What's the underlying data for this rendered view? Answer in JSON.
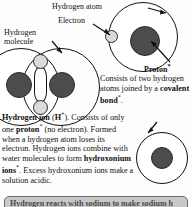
{
  "labels": {
    "hydrogen_atom": "Hydrogen atom",
    "electron": "Electron",
    "hydrogen_molecule_line1": "Hydrogen",
    "hydrogen_molecule_line2": "molecule",
    "proton": "Proton",
    "proton_marker": "*"
  },
  "covalent_text": {
    "lead": "Consists of two hydrogen atoms joined by a ",
    "bold": "covalent bond",
    "marker": "*",
    "tail": "."
  },
  "ion_text": {
    "title": "Hydrogen ion",
    "formula_open": " (",
    "formula": "H",
    "formula_charge": "+",
    "formula_close": "). Consists of only one ",
    "bold_proton": "proton",
    "proton_marker": "*",
    "mid": " (no electron). Formed when a hydrogen atom loses its electron. Hydrogen ions combine with water molecules to form ",
    "bold_hydroxonium": "hydroxonium ions",
    "hydroxonium_marker": "*",
    "tail": ". Excess hydroxonium ions make a solution acidic."
  },
  "bottom_banner": {
    "text": "Hydrogen reacts with sodium to make sodium h"
  },
  "colors": {
    "nucleus": "#4c4c4c",
    "electron": "#dadada",
    "outline": "#111111",
    "banner_fill": "#c9c9c9",
    "banner_border": "#6d6d6d",
    "page_background": "#fdfdfd"
  },
  "diagram": {
    "atom_name": "hydrogen-atom-diagram",
    "molecule_name": "hydrogen-molecule-diagram",
    "ion_name": "hydrogen-ion-diagram"
  }
}
